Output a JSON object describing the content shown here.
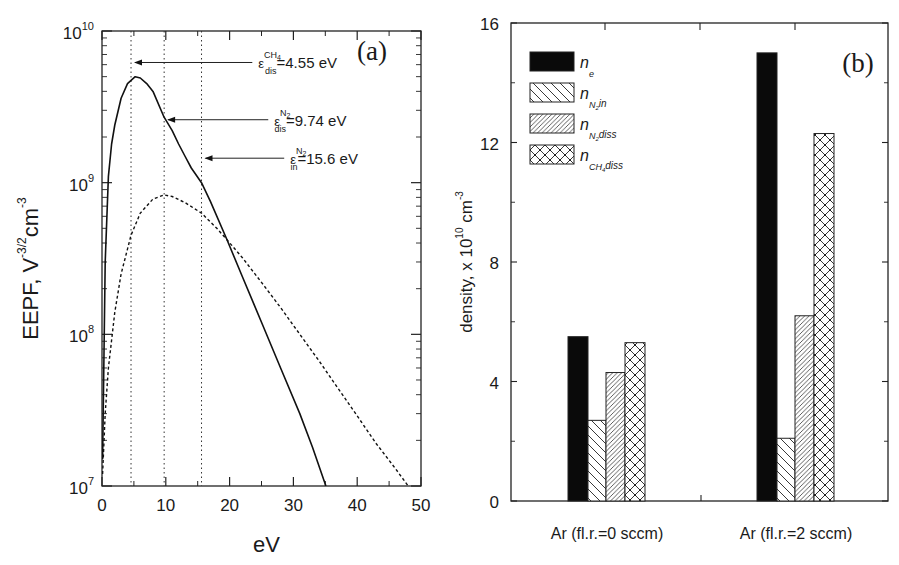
{
  "chart_data": [
    {
      "panel": "(a)",
      "type": "line",
      "xlabel": "eV",
      "ylabel": "EEPF, V^-3/2 cm^-3",
      "ylabel_parts": {
        "main": "EEPF, V",
        "sup1": "-3/2",
        "mid": "cm",
        "sup2": "-3"
      },
      "xscale": "linear",
      "yscale": "log",
      "xlim": [
        0,
        50
      ],
      "ylim": [
        10000000.0,
        10000000000.0
      ],
      "xticks": [
        0,
        10,
        20,
        30,
        40,
        50
      ],
      "yticks": [
        {
          "base": "10",
          "exp": "7",
          "value": 10000000.0
        },
        {
          "base": "10",
          "exp": "8",
          "value": 100000000.0
        },
        {
          "base": "10",
          "exp": "9",
          "value": 1000000000.0
        },
        {
          "base": "10",
          "exp": "10",
          "value": 10000000000.0
        }
      ],
      "grid": false,
      "series": [
        {
          "name": "EEPF (solid)",
          "style": "solid",
          "x": [
            0.1,
            0.5,
            1,
            1.5,
            2,
            3,
            4,
            5.2,
            6,
            7,
            8,
            9.74,
            11,
            12,
            13,
            14,
            15.6,
            17,
            19.6,
            22,
            25,
            28,
            31,
            33,
            35.1
          ],
          "y": [
            15000000.0,
            300000000.0,
            1100000000.0,
            1800000000.0,
            2400000000.0,
            3600000000.0,
            4500000000.0,
            5000000000.0,
            4900000000.0,
            4500000000.0,
            4000000000.0,
            2700000000.0,
            2200000000.0,
            1800000000.0,
            1500000000.0,
            1250000000.0,
            1000000000.0,
            750000000.0,
            420000000.0,
            240000000.0,
            120000000.0,
            60000000.0,
            30000000.0,
            18000000.0,
            10000000.0
          ]
        },
        {
          "name": "EEPF (dashed)",
          "style": "dashed",
          "x": [
            0.1,
            0.5,
            1,
            2,
            3,
            4.55,
            6,
            8,
            9.74,
            11,
            13,
            15.6,
            18,
            19.6,
            22,
            25,
            28,
            31,
            34,
            37,
            40,
            43,
            46,
            48
          ],
          "y": [
            12000000.0,
            30000000.0,
            60000000.0,
            140000000.0,
            250000000.0,
            450000000.0,
            630000000.0,
            780000000.0,
            830000000.0,
            810000000.0,
            740000000.0,
            630000000.0,
            500000000.0,
            420000000.0,
            320000000.0,
            220000000.0,
            150000000.0,
            100000000.0,
            67000000.0,
            44000000.0,
            29000000.0,
            19000000.0,
            13000000.0,
            10000000.0
          ]
        }
      ],
      "vlines": [
        {
          "x": 4.55,
          "label": "ε^CH4_dis=4.55 eV",
          "sym": "ε",
          "sup": "CH",
          "sup_sub": "4",
          "sub": "dis",
          "value": "=4.55 eV",
          "arrow_y": 6200000000.0,
          "label_x": 24.5
        },
        {
          "x": 9.74,
          "label": "ε^N2_dis=9.74 eV",
          "sym": "ε",
          "sup": "N",
          "sup_sub": "2",
          "sub": "dis",
          "value": "=9.74 eV",
          "arrow_y": 2600000000.0,
          "label_x": 27
        },
        {
          "x": 15.6,
          "label": "ε^N2_in=15.6 eV",
          "sym": "ε",
          "sup": "N",
          "sup_sub": "2",
          "sub": "in",
          "value": "=15.6 eV",
          "arrow_y": 1450000000.0,
          "label_x": 29.5
        }
      ],
      "annotation": "(a)"
    },
    {
      "panel": "(b)",
      "type": "bar",
      "title": "",
      "xlabel": "",
      "ylabel": "density, x 10^10 cm^-3",
      "ylabel_parts": {
        "main": "density, x 10",
        "sup1": "10",
        "mid": "cm",
        "sup2": "-3"
      },
      "ylim": [
        0,
        16
      ],
      "yticks": [
        0,
        4,
        8,
        12,
        16
      ],
      "grid": false,
      "categories": [
        "Ar (fl.r.=0 sccm)",
        "Ar (fl.r.=2 sccm)"
      ],
      "series": [
        {
          "name": "n_e",
          "label_main": "n",
          "label_sub": "e",
          "label_subsub": "",
          "label_tail": "",
          "pattern": "solid",
          "values": [
            5.5,
            15.0
          ]
        },
        {
          "name": "n_N2,in",
          "label_main": "n",
          "label_sub": "N",
          "label_subsub": "2",
          "label_tail": "in",
          "pattern": "diag-back",
          "values": [
            2.7,
            2.1
          ]
        },
        {
          "name": "n_N2,diss",
          "label_main": "n",
          "label_sub": "N",
          "label_subsub": "2",
          "label_tail": "diss",
          "pattern": "diag-fwd",
          "values": [
            4.3,
            6.2
          ]
        },
        {
          "name": "n_CH4,diss",
          "label_main": "n",
          "label_sub": "CH",
          "label_subsub": "4",
          "label_tail": "diss",
          "pattern": "crosshatch",
          "values": [
            5.3,
            12.3
          ]
        }
      ],
      "legend_position": "upper left",
      "annotation": "(b)"
    }
  ]
}
